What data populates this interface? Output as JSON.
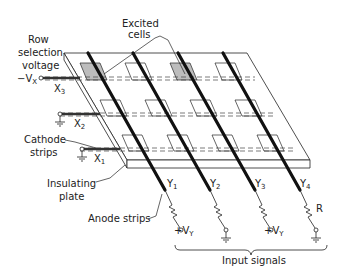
{
  "labels": {
    "row_selection_1": "Row",
    "row_selection_2": "selection",
    "row_selection_3": "voltage",
    "neg_vx": "−V",
    "neg_vx_sub": "X",
    "x3": "X",
    "x3_sub": "3",
    "x2": "X",
    "x2_sub": "2",
    "x1": "X",
    "x1_sub": "1",
    "excited_1": "Excited",
    "excited_2": "cells",
    "cathode_1": "Cathode",
    "cathode_2": "strips",
    "insulating_1": "Insulating",
    "insulating_2": "plate",
    "anode": "Anode strips",
    "y1": "Y",
    "y1_sub": "1",
    "y2": "Y",
    "y2_sub": "2",
    "y3": "Y",
    "y3_sub": "3",
    "y4": "Y",
    "y4_sub": "4",
    "vy1": "+V",
    "vy1_sub": "Y",
    "vy3": "+V",
    "vy3_sub": "Y",
    "r": "R",
    "input_signals": "Input signals"
  },
  "colors": {
    "line": "#222222",
    "excited_fill": "#bdbdbd",
    "anode": "#111111"
  }
}
